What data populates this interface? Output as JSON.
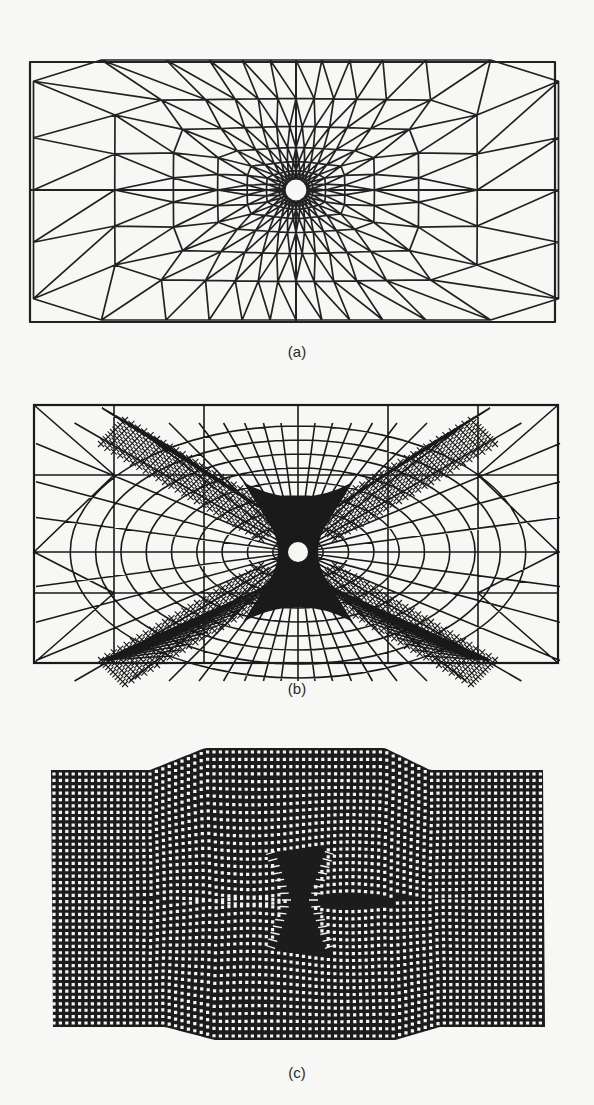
{
  "figure": {
    "panels": [
      {
        "id": "a",
        "label": "(a)",
        "description": "Initial unstructured triangular finite-element mesh of a rectangular plate with a small central circular hole; elements graded finer toward the hole",
        "bounds": {
          "x0": 30,
          "y0": 62,
          "x1": 555,
          "y1": 322
        },
        "hole": {
          "cx": 296,
          "cy": 190,
          "r": 10
        },
        "line_color": "#222222"
      },
      {
        "id": "b",
        "label": "(b)",
        "description": "Adaptively refined triangular mesh; dense refinement bands form an X-shaped pattern radiating diagonally from the central hole toward the plate corners",
        "bounds": {
          "x0": 34,
          "y0": 405,
          "x1": 558,
          "y1": 663
        },
        "hole": {
          "cx": 298,
          "cy": 552,
          "r": 10
        },
        "line_color": "#1a1a1a"
      },
      {
        "id": "c",
        "label": "(c)",
        "description": "Deformed regular quadrilateral grid (dense dotted appearance) showing necking: plate edges bulge outward in the middle section, with an hourglass-shaped highly distorted region at the center",
        "bounds": {
          "x0": 51,
          "y0": 748,
          "x1": 545,
          "y1": 1040
        },
        "grid_spacing": 6.4,
        "line_color": "#1c1c1c"
      }
    ],
    "captions": {
      "a": "(a)",
      "b": "(b)",
      "c": "(c)"
    },
    "background_color": "#f7f7f5"
  }
}
